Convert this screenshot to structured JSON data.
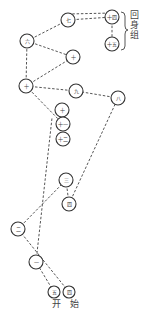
{
  "diagram": {
    "group_label": "回身组",
    "start_label": "开 始",
    "nodes": [
      {
        "id": "A",
        "label": "七",
        "x": 68,
        "y": 20
      },
      {
        "id": "B",
        "label": "十四",
        "x": 112,
        "y": 17
      },
      {
        "id": "C",
        "label": "十五",
        "x": 112,
        "y": 44
      },
      {
        "id": "D",
        "label": "六",
        "x": 27,
        "y": 41
      },
      {
        "id": "E",
        "label": "十",
        "x": 73,
        "y": 57
      },
      {
        "id": "F",
        "label": "十",
        "x": 26,
        "y": 86
      },
      {
        "id": "G",
        "label": "九",
        "x": 76,
        "y": 91
      },
      {
        "id": "H",
        "label": "八",
        "x": 118,
        "y": 98
      },
      {
        "id": "I",
        "label": "十",
        "x": 62,
        "y": 110
      },
      {
        "id": "J",
        "label": "十一",
        "x": 63,
        "y": 124
      },
      {
        "id": "K",
        "label": "十二",
        "x": 63,
        "y": 139
      },
      {
        "id": "L",
        "label": "三",
        "x": 66,
        "y": 180
      },
      {
        "id": "M",
        "label": "四",
        "x": 69,
        "y": 204
      },
      {
        "id": "N",
        "label": "二",
        "x": 18,
        "y": 229
      },
      {
        "id": "O",
        "label": "一",
        "x": 36,
        "y": 262
      },
      {
        "id": "P",
        "label": "五",
        "x": 54,
        "y": 292
      },
      {
        "id": "Q",
        "label": "四",
        "x": 69,
        "y": 292
      }
    ],
    "edges": [
      [
        "P",
        "O"
      ],
      [
        "Q",
        "N"
      ],
      [
        "O",
        "J"
      ],
      [
        "N",
        "L"
      ],
      [
        "L",
        "M"
      ],
      [
        "M",
        "H"
      ],
      [
        "H",
        "G"
      ],
      [
        "G",
        "F"
      ],
      [
        "F",
        "J"
      ],
      [
        "F",
        "D"
      ],
      [
        "F",
        "E"
      ],
      [
        "D",
        "A"
      ],
      [
        "D",
        "E"
      ],
      [
        "A",
        "B"
      ],
      [
        "A",
        "B2"
      ],
      [
        "B",
        "C"
      ]
    ]
  }
}
